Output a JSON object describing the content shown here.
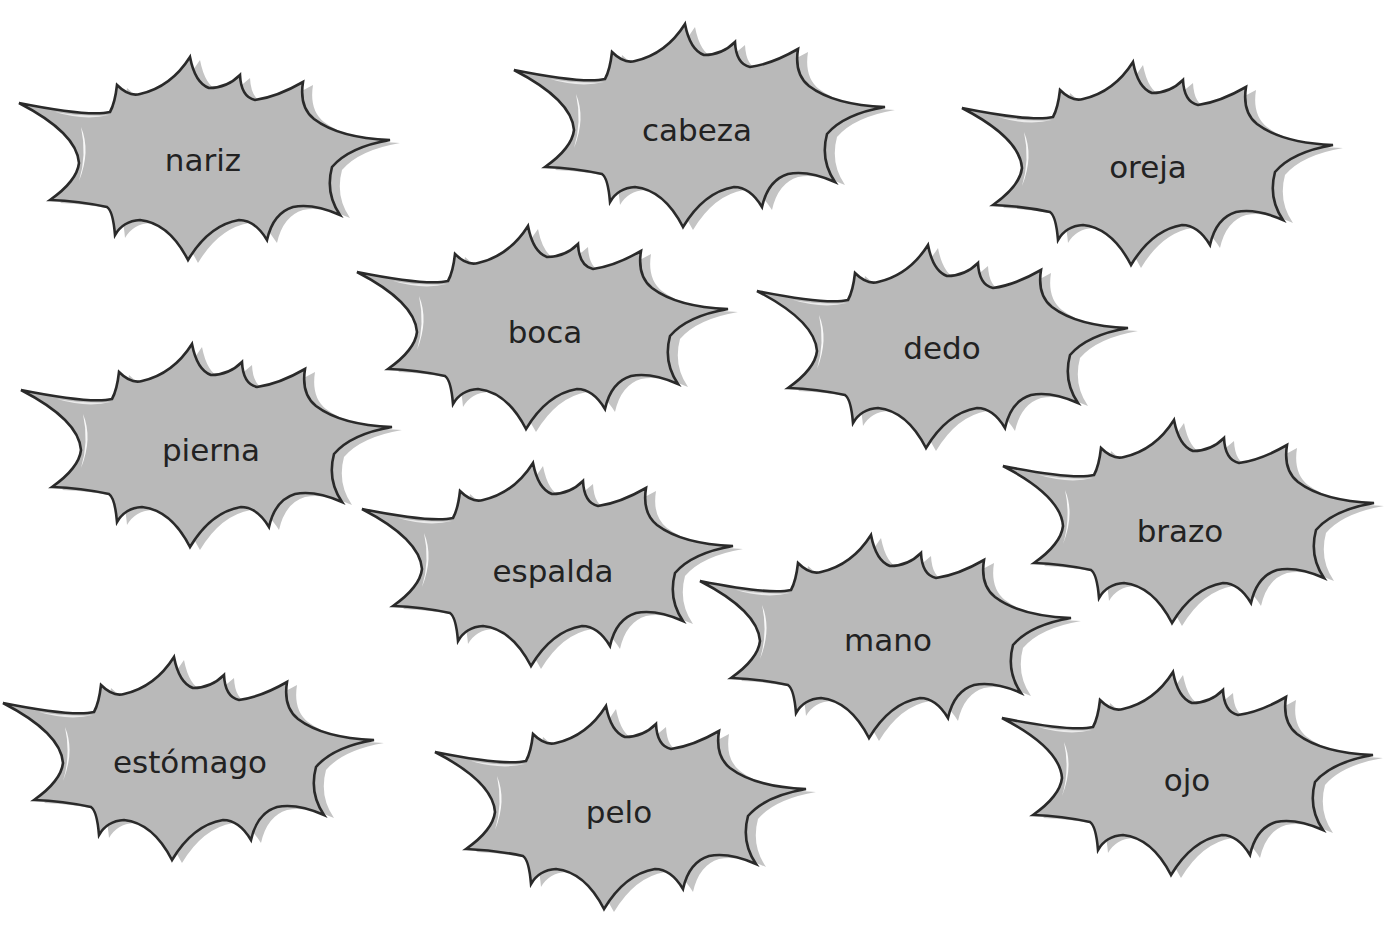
{
  "colors": {
    "background": "#ffffff",
    "fill": "#b9b9b9",
    "shadow": "#c4c4c4",
    "highlight": "#ffffff",
    "outline": "#2a2a2a",
    "text": "#222222"
  },
  "bursts": [
    {
      "word": "nariz",
      "tip": [
        19,
        103
      ],
      "label": [
        203,
        160
      ]
    },
    {
      "word": "cabeza",
      "tip": [
        514,
        70
      ],
      "label": [
        697,
        130
      ]
    },
    {
      "word": "oreja",
      "tip": [
        962,
        108
      ],
      "label": [
        1148,
        167
      ]
    },
    {
      "word": "boca",
      "tip": [
        357,
        272
      ],
      "label": [
        545,
        332
      ]
    },
    {
      "word": "dedo",
      "tip": [
        757,
        291
      ],
      "label": [
        942,
        348
      ]
    },
    {
      "word": "pierna",
      "tip": [
        21,
        390
      ],
      "label": [
        211,
        450
      ]
    },
    {
      "word": "espalda",
      "tip": [
        362,
        509
      ],
      "label": [
        553,
        571
      ]
    },
    {
      "word": "brazo",
      "tip": [
        1003,
        466
      ],
      "label": [
        1180,
        531
      ]
    },
    {
      "word": "mano",
      "tip": [
        700,
        581
      ],
      "label": [
        888,
        640
      ]
    },
    {
      "word": "estómago",
      "tip": [
        3,
        703
      ],
      "label": [
        190,
        762
      ]
    },
    {
      "word": "pelo",
      "tip": [
        435,
        752
      ],
      "label": [
        619,
        812
      ]
    },
    {
      "word": "ojo",
      "tip": [
        1002,
        718
      ],
      "label": [
        1187,
        780
      ]
    }
  ]
}
